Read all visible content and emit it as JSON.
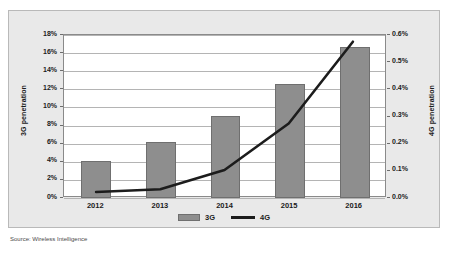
{
  "source_note": "Source: Wireless Intelligence",
  "legend": {
    "items": [
      {
        "label": "3G",
        "type": "bar-swatch",
        "color": "#8e8e8e"
      },
      {
        "label": "4G",
        "type": "line-swatch",
        "color": "#1c1c1c"
      }
    ]
  },
  "colors": {
    "bar_fill": "#8e8e8e",
    "bar_stroke": "#6f6f6f",
    "line": "#1c1c1c",
    "plot_background": "#ffffff",
    "chart_background": "#e9e9e9",
    "gridline": "#b4b4b4",
    "frame_border": "#b9b9b9",
    "text": "#1b1b1b"
  },
  "chart_data": {
    "type": "bar",
    "title": "",
    "subtitle": "",
    "xlabel": "",
    "ylabel": "3G penetration",
    "y2label": "4G penetration",
    "grid": true,
    "legend_position": "bottom",
    "categories": [
      "2012",
      "2013",
      "2014",
      "2015",
      "2016"
    ],
    "ylim": [
      0,
      18
    ],
    "y2lim": [
      0,
      0.6
    ],
    "yticks": [
      "0%",
      "2%",
      "4%",
      "6%",
      "8%",
      "10%",
      "12%",
      "14%",
      "16%",
      "18%"
    ],
    "ytick_values": [
      0,
      2,
      4,
      6,
      8,
      10,
      12,
      14,
      16,
      18
    ],
    "y2ticks": [
      "0.0%",
      "0.1%",
      "0.2%",
      "0.3%",
      "0.4%",
      "0.5%",
      "0.6%"
    ],
    "y2tick_values": [
      0,
      0.1,
      0.2,
      0.3,
      0.4,
      0.5,
      0.6
    ],
    "series": [
      {
        "name": "3G",
        "type": "bar",
        "axis": "left",
        "unit": "%",
        "values": [
          4.1,
          6.2,
          9.05,
          12.6,
          16.7
        ]
      },
      {
        "name": "4G",
        "type": "line",
        "axis": "right",
        "unit": "%",
        "values": [
          0.015,
          0.025,
          0.097,
          0.27,
          0.575
        ]
      }
    ]
  }
}
